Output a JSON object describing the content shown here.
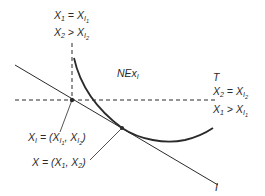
{
  "figure": {
    "type": "economic indifference diagram",
    "colors": {
      "ink": "#2a2a2a",
      "background": "#ffffff"
    },
    "labels": {
      "top_line1": {
        "lhs": "X",
        "lhs_sub": "1",
        "op": "=",
        "rhs": "X",
        "rhs_sub": "I",
        "rhs_subsub": "1"
      },
      "top_line2": {
        "lhs": "X",
        "lhs_sub": "2",
        "op": ">",
        "rhs": "X",
        "rhs_sub": "I",
        "rhs_subsub": "2"
      },
      "region": {
        "text": "NEx",
        "sub": "I"
      },
      "right_T": "T",
      "right_line1": {
        "lhs": "X",
        "lhs_sub": "2",
        "op": "=",
        "rhs": "X",
        "rhs_sub": "I",
        "rhs_subsub": "2"
      },
      "right_line2": {
        "lhs": "X",
        "lhs_sub": "1",
        "op": ">",
        "rhs": "X",
        "rhs_sub": "I",
        "rhs_subsub": "1"
      },
      "point_xi": {
        "lhs": "X",
        "lhs_sub": "I",
        "op": "= (",
        "a": "X",
        "a_sub": "I",
        "a_subsub": "1",
        "sep": ", ",
        "b": "X",
        "b_sub": "I",
        "b_subsub": "2",
        "close": ")"
      },
      "point_x": {
        "lhs": "X",
        "op": "= (",
        "a": "X",
        "a_sub": "1",
        "sep": ", ",
        "b": "X",
        "b_sub": "2",
        "close": ")"
      },
      "line_I": "I"
    },
    "points": {
      "XI": {
        "x": 72,
        "y": 100
      },
      "X": {
        "x": 122,
        "y": 128
      }
    }
  }
}
